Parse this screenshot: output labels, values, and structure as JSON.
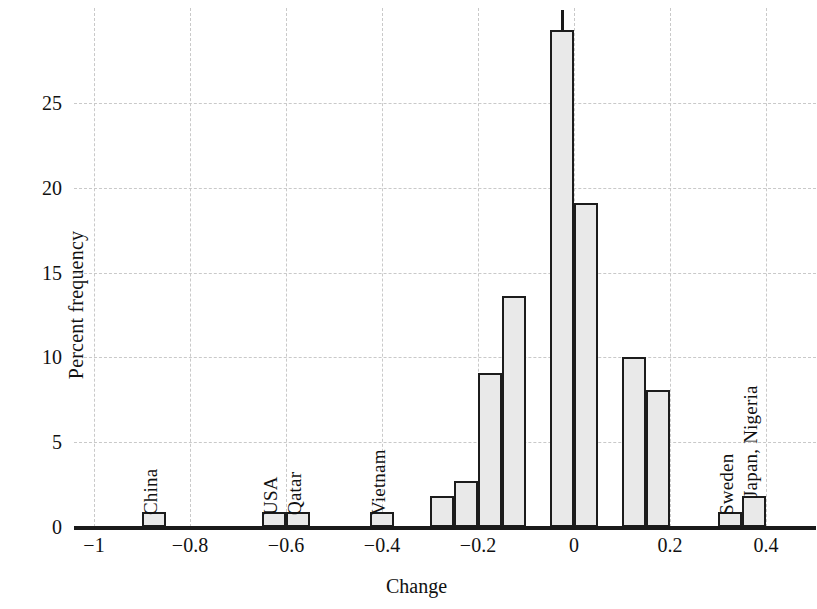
{
  "chart_data": {
    "type": "bar",
    "title": "",
    "subtitle": "",
    "xlabel": "Change",
    "ylabel": "Percent frequency",
    "xlim": [
      -1.05,
      0.45
    ],
    "ylim": [
      0,
      30
    ],
    "grid": true,
    "legend": null,
    "bin_width": 0.05,
    "xticks": [
      {
        "value": -1,
        "label": "−1"
      },
      {
        "value": -0.8,
        "label": "−0.8"
      },
      {
        "value": -0.6,
        "label": "−0.6"
      },
      {
        "value": -0.4,
        "label": "−0.4"
      },
      {
        "value": -0.2,
        "label": "−0.2"
      },
      {
        "value": 0,
        "label": "0"
      },
      {
        "value": 0.2,
        "label": "0.2"
      },
      {
        "value": 0.4,
        "label": "0.4"
      }
    ],
    "yticks": [
      {
        "value": 0,
        "label": "0"
      },
      {
        "value": 5,
        "label": "5"
      },
      {
        "value": 10,
        "label": "10"
      },
      {
        "value": 15,
        "label": "15"
      },
      {
        "value": 20,
        "label": "20"
      },
      {
        "value": 25,
        "label": "25"
      }
    ],
    "bars": [
      {
        "center": -0.875,
        "value": 0.9
      },
      {
        "center": -0.625,
        "value": 0.9
      },
      {
        "center": -0.575,
        "value": 0.9
      },
      {
        "center": -0.4,
        "value": 0.9
      },
      {
        "center": -0.275,
        "value": 1.8
      },
      {
        "center": -0.225,
        "value": 2.7
      },
      {
        "center": -0.175,
        "value": 9.1
      },
      {
        "center": -0.125,
        "value": 13.6
      },
      {
        "center": -0.025,
        "value": 29.3
      },
      {
        "center": 0.025,
        "value": 19.1
      },
      {
        "center": 0.125,
        "value": 10.0
      },
      {
        "center": 0.175,
        "value": 8.1
      },
      {
        "center": 0.325,
        "value": 0.9
      },
      {
        "center": 0.375,
        "value": 1.8
      }
    ],
    "annotations": [
      {
        "text": "China",
        "center": -0.875,
        "base": 1.2
      },
      {
        "text": "USA",
        "center": -0.625,
        "base": 1.2
      },
      {
        "text": "Qatar",
        "center": -0.575,
        "base": 1.2
      },
      {
        "text": "Vietnam",
        "center": -0.4,
        "base": 1.2
      },
      {
        "text": "Sweden",
        "center": 0.325,
        "base": 1.2
      },
      {
        "text": "Japan, Nigeria",
        "center": 0.375,
        "base": 2.2
      }
    ],
    "marker_tick": {
      "center": -0.025,
      "from": 29.3,
      "to": 30.5
    },
    "colors": {
      "bar_fill": "#e9e9e9",
      "bar_edge": "#1c1c1c",
      "grid": "#c9c9c9",
      "axis": "#1a1a1a",
      "text": "#111111",
      "background": "#ffffff"
    }
  }
}
